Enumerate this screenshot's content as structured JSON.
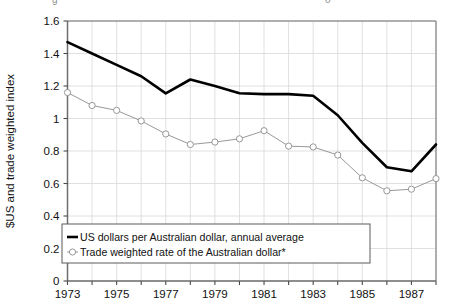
{
  "figure": {
    "background": "#ffffff",
    "cropped_title_fragments": [
      "g",
      "o"
    ]
  },
  "axis": {
    "y_title": "$US and trade weighted index",
    "y_ticks": [
      "0",
      "0.2",
      "0.4",
      "0.6",
      "0.8",
      "1",
      "1.2",
      "1.4",
      "1.6"
    ],
    "x_ticks": [
      "1973",
      "1975",
      "1977",
      "1979",
      "1981",
      "1983",
      "1985",
      "1987"
    ]
  },
  "legend": {
    "entries": [
      {
        "label": "US dollars per Australian dollar, annual average",
        "marker": "thick-line",
        "color": "#000000"
      },
      {
        "label": "Trade weighted rate of the Australian dollar*",
        "marker": "line-with-open-circle",
        "color": "#8c8c8c"
      }
    ]
  },
  "chart_data": {
    "type": "line",
    "title": "",
    "xlabel": "",
    "ylabel": "$US and trade weighted index",
    "xlim": [
      1973,
      1988
    ],
    "ylim": [
      0,
      1.6
    ],
    "ytick_step": 0.2,
    "xtick_step": 1,
    "xtick_label_step": 2,
    "grid": true,
    "legend_position": "lower-left",
    "x": [
      1973,
      1974,
      1975,
      1976,
      1977,
      1978,
      1979,
      1980,
      1981,
      1982,
      1983,
      1984,
      1985,
      1986,
      1987,
      1988
    ],
    "series": [
      {
        "name": "US dollars per Australian dollar, annual average",
        "color": "#000000",
        "linewidth": 2.6,
        "marker": "none",
        "values": [
          1.47,
          1.4,
          1.33,
          1.26,
          1.155,
          1.24,
          1.2,
          1.155,
          1.15,
          1.15,
          1.14,
          1.02,
          0.85,
          0.7,
          0.675,
          0.84
        ]
      },
      {
        "name": "Trade weighted rate of the Australian dollar*",
        "color": "#8c8c8c",
        "linewidth": 0.9,
        "marker": "open-circle",
        "values": [
          1.16,
          1.08,
          1.05,
          0.985,
          0.905,
          0.84,
          0.855,
          0.875,
          0.925,
          0.83,
          0.825,
          0.775,
          0.635,
          0.555,
          0.565,
          0.63
        ]
      }
    ]
  }
}
